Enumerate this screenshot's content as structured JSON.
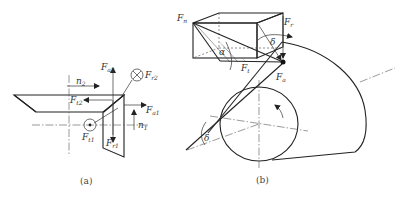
{
  "figure_a": {
    "caption": "(a)",
    "labels": {
      "Fa2": {
        "main": "F",
        "sub": "a2"
      },
      "Fr2": {
        "main": "F",
        "sub": "r2"
      },
      "Ft2": {
        "main": "F",
        "sub": "t2"
      },
      "n2": {
        "main": "n",
        "sub": "2"
      },
      "Fa1": {
        "main": "F",
        "sub": "a1"
      },
      "n1": {
        "main": "n",
        "sub": "1"
      },
      "Ft1": {
        "main": "F",
        "sub": "t1"
      },
      "Fr1": {
        "main": "F",
        "sub": "r1"
      }
    },
    "symbols": {
      "into_page": "⊗",
      "out_of_page": "⊙"
    }
  },
  "figure_b": {
    "caption": "(b)",
    "labels": {
      "Fn": {
        "main": "F",
        "sub": "n"
      },
      "Fr": {
        "main": "F",
        "sub": "r"
      },
      "Ft": {
        "main": "F",
        "sub": "t"
      },
      "Fa": {
        "main": "F",
        "sub": "a"
      },
      "alpha": "α",
      "delta_top": "δ",
      "delta_bottom": "δ"
    }
  }
}
